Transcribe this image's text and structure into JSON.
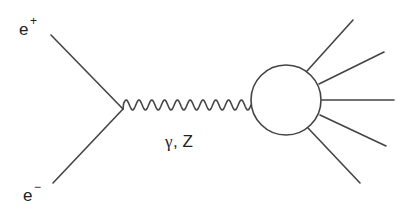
{
  "diagram": {
    "type": "feynman",
    "incoming": [
      {
        "base": "e",
        "charge": "+"
      },
      {
        "base": "e",
        "charge": "−"
      }
    ],
    "propagator": {
      "label_greek": "γ",
      "label_rest": ", Z",
      "style": "wavy"
    },
    "blob": {
      "kind": "hadronic-blob"
    },
    "outgoing_count": 5,
    "line_color": "#444444",
    "text_color": "#222222"
  }
}
